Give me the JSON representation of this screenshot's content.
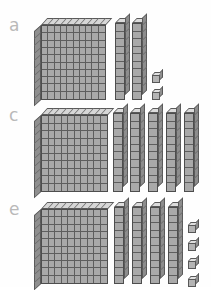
{
  "page": {
    "kind": "base-ten-blocks-worksheet",
    "background_color": "#fefefe",
    "block_fill_color": "#a9a9a9",
    "block_line_color": "#545454",
    "label_color": "#b9b9b9",
    "flat_top_color": "#d7d7d7",
    "flat_left_color": "#8f8f8f"
  },
  "rows": [
    {
      "label": "a",
      "hundreds": 1,
      "tens": 2,
      "ones": 2,
      "total": 122,
      "flat": {
        "left": 34,
        "top": 4,
        "width": 72,
        "height": 82,
        "columns": 10,
        "rows": 10
      },
      "rods": [
        {
          "left": 115,
          "top": 4,
          "width": 10,
          "height": 82,
          "segments": 10
        },
        {
          "left": 132,
          "top": 4,
          "width": 10,
          "height": 82,
          "segments": 10
        }
      ],
      "units": [
        {
          "left": 152,
          "top": 58
        },
        {
          "left": 152,
          "top": 75
        }
      ]
    },
    {
      "label": "c",
      "hundreds": 1,
      "tens": 5,
      "ones": 0,
      "total": 150,
      "flat": {
        "left": 34,
        "top": 4,
        "width": 74,
        "height": 84,
        "columns": 10,
        "rows": 10
      },
      "rods": [
        {
          "left": 113,
          "top": 4,
          "width": 10,
          "height": 84,
          "segments": 10
        },
        {
          "left": 130,
          "top": 4,
          "width": 10,
          "height": 84,
          "segments": 10
        },
        {
          "left": 148,
          "top": 4,
          "width": 10,
          "height": 84,
          "segments": 10
        },
        {
          "left": 166,
          "top": 4,
          "width": 10,
          "height": 84,
          "segments": 10
        },
        {
          "left": 184,
          "top": 4,
          "width": 10,
          "height": 84,
          "segments": 10
        }
      ],
      "units": []
    },
    {
      "label": "e",
      "hundreds": 1,
      "tens": 4,
      "ones": 4,
      "total": 144,
      "flat": {
        "left": 34,
        "top": 4,
        "width": 74,
        "height": 82,
        "columns": 10,
        "rows": 10
      },
      "rods": [
        {
          "left": 114,
          "top": 4,
          "width": 10,
          "height": 82,
          "segments": 10
        },
        {
          "left": 132,
          "top": 4,
          "width": 10,
          "height": 82,
          "segments": 10
        },
        {
          "left": 150,
          "top": 4,
          "width": 10,
          "height": 82,
          "segments": 10
        },
        {
          "left": 168,
          "top": 4,
          "width": 10,
          "height": 82,
          "segments": 10
        }
      ],
      "units": [
        {
          "left": 188,
          "top": 24
        },
        {
          "left": 188,
          "top": 42
        },
        {
          "left": 188,
          "top": 60
        },
        {
          "left": 188,
          "top": 78
        }
      ]
    }
  ]
}
